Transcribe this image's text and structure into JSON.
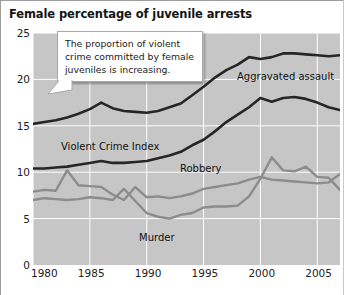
{
  "chart_data": {
    "type": "line",
    "title": "Female percentage of juvenile arrests",
    "xlabel": "",
    "ylabel": "",
    "xlim": [
      1980,
      2007
    ],
    "ylim": [
      0,
      25
    ],
    "yticks": [
      0,
      5,
      10,
      15,
      20,
      25
    ],
    "xticks": [
      1980,
      1985,
      1990,
      1995,
      2000,
      2005
    ],
    "grid": true,
    "legend_position": "inline-labels",
    "plot_background": "#c6c6c6",
    "gridline_color": "#ffffff",
    "x": [
      1980,
      1981,
      1982,
      1983,
      1984,
      1985,
      1986,
      1987,
      1988,
      1989,
      1990,
      1991,
      1992,
      1993,
      1994,
      1995,
      1996,
      1997,
      1998,
      1999,
      2000,
      2001,
      2002,
      2003,
      2004,
      2005,
      2006,
      2007
    ],
    "series": [
      {
        "name": "Aggravated assault",
        "color": "#262626",
        "width": 2.6,
        "values": [
          15.2,
          15.4,
          15.6,
          15.9,
          16.3,
          16.8,
          17.5,
          16.9,
          16.6,
          16.5,
          16.4,
          16.6,
          17.0,
          17.4,
          18.3,
          19.2,
          20.2,
          21.0,
          21.6,
          22.4,
          22.2,
          22.4,
          22.8,
          22.8,
          22.7,
          22.6,
          22.5,
          22.6
        ]
      },
      {
        "name": "Violent Crime Index",
        "color": "#262626",
        "width": 2.6,
        "values": [
          10.4,
          10.4,
          10.5,
          10.6,
          10.8,
          11.0,
          11.2,
          11.0,
          11.0,
          11.1,
          11.2,
          11.5,
          11.8,
          12.2,
          12.9,
          13.5,
          14.4,
          15.4,
          16.2,
          17.0,
          18.0,
          17.6,
          18.0,
          18.1,
          17.9,
          17.5,
          17.0,
          16.7
        ]
      },
      {
        "name": "Robbery",
        "color": "#8c8c8c",
        "width": 2.4,
        "values": [
          7.9,
          8.1,
          8.0,
          10.2,
          8.6,
          8.5,
          8.4,
          7.6,
          7.0,
          8.4,
          7.3,
          7.4,
          7.2,
          7.4,
          7.7,
          8.2,
          8.4,
          8.6,
          8.8,
          9.2,
          9.5,
          9.2,
          9.1,
          9.0,
          8.9,
          8.8,
          8.9,
          9.8
        ]
      },
      {
        "name": "Murder",
        "color": "#8c8c8c",
        "width": 2.4,
        "values": [
          7.0,
          7.2,
          7.1,
          7.0,
          7.1,
          7.3,
          7.2,
          7.0,
          8.2,
          6.9,
          5.6,
          5.2,
          5.0,
          5.4,
          5.6,
          6.2,
          6.3,
          6.3,
          6.4,
          7.4,
          9.3,
          11.6,
          10.2,
          10.1,
          10.6,
          9.5,
          9.4,
          8.1
        ]
      }
    ],
    "series_labels": [
      {
        "text": "Aggravated assault",
        "x_px": 237,
        "y_px": 72
      },
      {
        "text": "Violent Crime Index",
        "x_px": 61,
        "y_px": 142
      },
      {
        "text": "Robbery",
        "x_px": 180,
        "y_px": 164
      },
      {
        "text": "Murder",
        "x_px": 139,
        "y_px": 233
      }
    ],
    "annotations": [
      {
        "id": "callout",
        "text": "The proportion of violent crime committed by female juveniles is increasing."
      }
    ]
  }
}
